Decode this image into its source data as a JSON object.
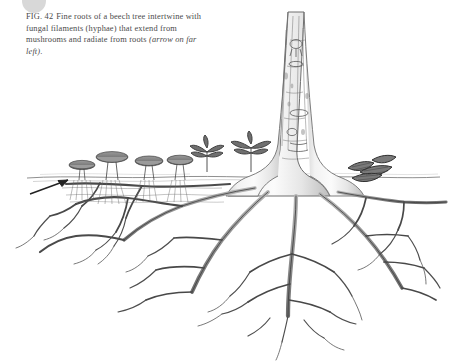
{
  "figure": {
    "label": "FIG. 42",
    "caption_line1": "Fine roots of a beech tree intertwine",
    "caption_line2": "with fungal filaments (hyphae) that extend",
    "caption_line3": "from mushrooms and radiate from roots",
    "caption_italic": "(arrow on far left)",
    "caption_end": ".",
    "caption_full": "FIG. 42  Fine roots of a beech tree intertwine with fungal filaments (hyphae) that extend from mushrooms and radiate from roots (arrow on far left)."
  },
  "avatar": {
    "name": "avatar",
    "color": "#d8d8d8"
  },
  "colors": {
    "background": "#ffffff",
    "ink": "#3a3a3a",
    "ink_light": "#8d8d8d",
    "caption_text": "#4a4a4a",
    "bark_shade": "#b9b9b9"
  },
  "illustration": {
    "ground_label": "soil-line",
    "trunk_label": "beech-trunk",
    "roots_label": "root-system",
    "mushrooms_label": "mushroom-cluster",
    "hyphae_label": "hyphae-filaments",
    "arrow_label": "pointer-arrow",
    "saplings_label": "sapling-seedlings",
    "bracket_fungi_label": "bracket-fungi"
  }
}
